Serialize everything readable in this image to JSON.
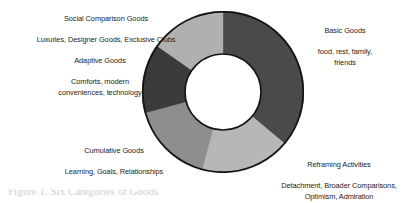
{
  "figure": {
    "name": "goods-donut-diagram",
    "background_color": "#ffffff",
    "caption_partial": "Figure 1. Six Categories of Goods"
  },
  "chart_data": {
    "type": "pie",
    "variant": "donut",
    "title": "",
    "legend_position": "labels-around-chart",
    "grid": false,
    "center_x": 222,
    "center_y": 92,
    "outer_radius": 80,
    "inner_radius": 38,
    "stroke_color": "#141414",
    "stroke_width": 1.6,
    "start_angle_deg": 0,
    "categories": [
      "Basic Goods",
      "Reframing Activities",
      "Cumulative Goods",
      "Adaptive Goods",
      "Social Comparison Goods"
    ],
    "values": [
      36.1,
      18.1,
      16.7,
      13.9,
      15.2
    ],
    "angles_deg": [
      130,
      65,
      60,
      50,
      55
    ],
    "colors": [
      "#4a4a4a",
      "#b7b7b7",
      "#8e8e8e",
      "#3b3b3b",
      "#b0b0b0"
    ],
    "segments": [
      {
        "label": "Basic Goods",
        "start_deg": 0,
        "end_deg": 130,
        "color": "#4a4a4a",
        "value": 36.1
      },
      {
        "label": "Reframing Activities",
        "start_deg": 130,
        "end_deg": 195,
        "color": "#b7b7b7",
        "value": 18.1
      },
      {
        "label": "Cumulative Goods",
        "start_deg": 195,
        "end_deg": 255,
        "color": "#8e8e8e",
        "value": 16.7
      },
      {
        "label": "Adaptive Goods",
        "start_deg": 255,
        "end_deg": 305,
        "color": "#3b3b3b",
        "value": 13.9
      },
      {
        "label": "Social Comparison Goods",
        "start_deg": 305,
        "end_deg": 360,
        "color": "#b0b0b0",
        "value": 15.2
      }
    ],
    "xlabel": "",
    "ylabel": ""
  },
  "labels": {
    "social": {
      "heading": "Social Comparison Goods",
      "items": "Luxuries, Designer Goods, Exclusive Clubs"
    },
    "adaptive": {
      "heading": "Adaptive Goods",
      "items": "Comforts, modern\nconveniences, technology"
    },
    "cumulative": {
      "heading": "Cumulative Goods",
      "items": "Learning, Goals, Relationships"
    },
    "basic": {
      "heading": "Basic Goods",
      "items": "food, rest, family,\nfriends"
    },
    "reframing": {
      "heading": "Reframing Activities",
      "items": "Detachment, Broader Comparisons,\nOptimism, Admiration"
    }
  }
}
